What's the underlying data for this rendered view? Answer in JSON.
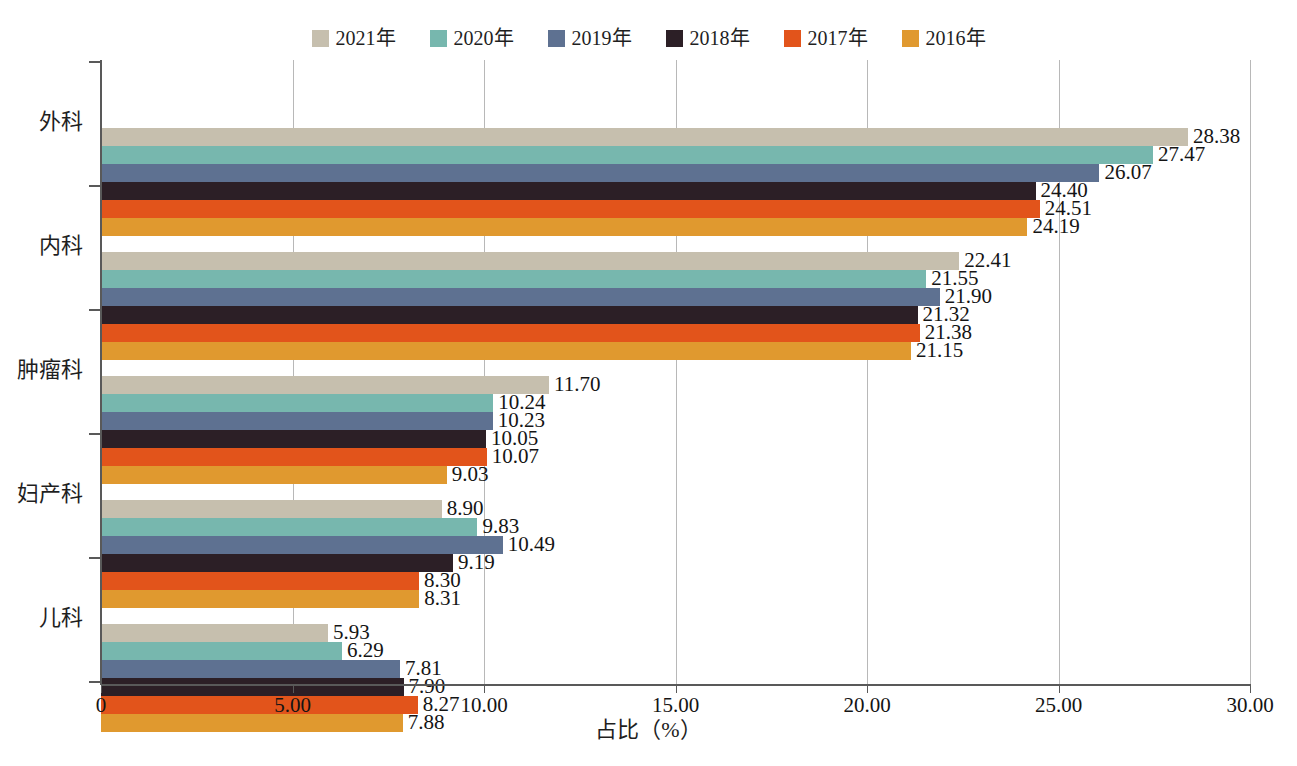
{
  "chart_data": {
    "type": "bar",
    "orientation": "horizontal",
    "title": "",
    "xlabel": "占比（%）",
    "ylabel": "",
    "xlim": [
      0,
      30
    ],
    "xticks": [
      "0",
      "5.00",
      "10.00",
      "15.00",
      "20.00",
      "25.00",
      "30.00"
    ],
    "xtick_values": [
      0,
      5,
      10,
      15,
      20,
      25,
      30
    ],
    "grid": true,
    "grid_axis": "x",
    "legend_position": "top-center",
    "categories": [
      "外科",
      "内科",
      "肿瘤科",
      "妇产科",
      "儿科"
    ],
    "series": [
      {
        "name": "2021年",
        "color": "#c6bfae",
        "values": [
          28.38,
          22.41,
          11.7,
          8.9,
          5.93
        ]
      },
      {
        "name": "2020年",
        "color": "#77b7ae",
        "values": [
          27.47,
          21.55,
          10.24,
          9.83,
          6.29
        ]
      },
      {
        "name": "2019年",
        "color": "#5e7191",
        "values": [
          26.07,
          21.9,
          10.23,
          10.49,
          7.81
        ]
      },
      {
        "name": "2018年",
        "color": "#2c1f26",
        "values": [
          24.4,
          21.32,
          10.05,
          9.19,
          7.9
        ]
      },
      {
        "name": "2017年",
        "color": "#e2541b",
        "values": [
          24.51,
          21.38,
          10.07,
          8.3,
          8.27
        ]
      },
      {
        "name": "2016年",
        "color": "#e0992f",
        "values": [
          24.19,
          21.15,
          9.03,
          8.31,
          7.88
        ]
      }
    ],
    "data_label_format": "0.00"
  },
  "axis": {
    "x_title": "占比（%）"
  }
}
